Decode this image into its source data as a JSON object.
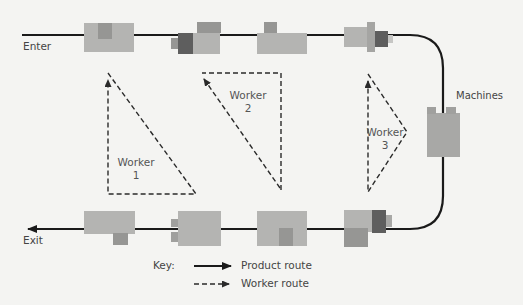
{
  "labels": {
    "enter": "Enter",
    "exit": "Exit",
    "machines": "Machines"
  },
  "workers": [
    {
      "line1": "Worker",
      "line2": "1"
    },
    {
      "line1": "Worker",
      "line2": "2"
    },
    {
      "line1": "Worker",
      "line2": "3"
    }
  ],
  "key": {
    "title": "Key:",
    "product_route": "Product route",
    "worker_route": "Worker route"
  },
  "colors": {
    "background": "#f4f4f2",
    "machine_light": "#b4b4b2",
    "machine_mid": "#969694",
    "machine_dark": "#5e5e5e",
    "line": "#1a1a1a"
  }
}
